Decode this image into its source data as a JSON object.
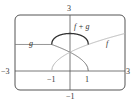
{
  "chart_data": {
    "type": "line",
    "title": "",
    "xlabel": "",
    "ylabel": "",
    "xlim": [
      -3,
      3
    ],
    "ylim": [
      -1,
      3
    ],
    "grid": false,
    "tick_labels": {
      "x_left": "−3",
      "x_right": "3",
      "x_neg1": "−1",
      "x_pos1": "1",
      "y_top": "3",
      "y_bottom": "−1"
    },
    "series": [
      {
        "name": "f",
        "label": "f",
        "formula": "sqrt(x+1)",
        "domain": [
          -1,
          3
        ],
        "color": "#b8b8b8",
        "x": [
          -1,
          -0.5,
          0,
          1,
          2,
          3
        ],
        "values": [
          0,
          0.71,
          1,
          1.41,
          1.73,
          2
        ]
      },
      {
        "name": "g",
        "label": "g",
        "formula": "sqrt(1-x)",
        "domain": [
          -3,
          1
        ],
        "color": "#777777",
        "x": [
          -3,
          -2,
          -1,
          0,
          0.5,
          1
        ],
        "values": [
          2,
          1.73,
          1.41,
          1,
          0.71,
          0
        ]
      },
      {
        "name": "f+g",
        "label": "f + g",
        "formula": "sqrt(x+1)+sqrt(1-x)",
        "domain": [
          -1,
          1
        ],
        "color": "#333333",
        "x": [
          -1,
          -0.5,
          0,
          0.5,
          1
        ],
        "values": [
          1.41,
          1.93,
          2,
          1.93,
          1.41
        ]
      }
    ]
  }
}
